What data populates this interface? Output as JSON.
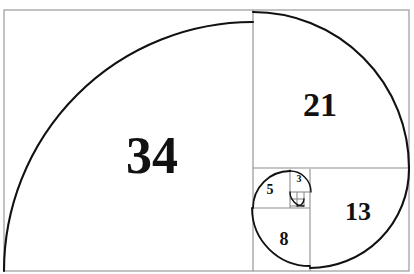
{
  "figure": {
    "background_color": "#ffffff",
    "outer_border_color": "#9a9a9a",
    "grid_line_color": "#8d8d8d",
    "spiral_color": "#111111",
    "label_color": "#111111",
    "outer_frame": {
      "x": 4,
      "y": 10,
      "width": 405,
      "height": 261
    }
  },
  "chart_data": {
    "type": "diagram",
    "xlabel": "",
    "ylabel": "",
    "grid": true,
    "legend_position": "none",
    "sequence": [
      1,
      1,
      2,
      3,
      5,
      8,
      13,
      21,
      34
    ],
    "visible_labels": [
      "34",
      "21",
      "13",
      "8",
      "5",
      "3"
    ],
    "squares": [
      {
        "label": "34",
        "value": 34,
        "x": 4,
        "y": 10,
        "size_w": 249,
        "size_h": 261,
        "label_x": 152,
        "label_y": 156,
        "label_font_px": 52,
        "arc_center_x": 253,
        "arc_center_y": 271,
        "arc_radius": 249,
        "arc_start_deg": 180,
        "arc_end_deg": 270
      },
      {
        "label": "21",
        "value": 21,
        "x": 253,
        "y": 10,
        "size_w": 156,
        "size_h": 158,
        "label_x": 320,
        "label_y": 105,
        "label_font_px": 34,
        "arc_center_x": 253,
        "arc_center_y": 168,
        "arc_radius": 156,
        "arc_start_deg": 270,
        "arc_end_deg": 360
      },
      {
        "label": "13",
        "value": 13,
        "x": 310,
        "y": 169,
        "size_w": 99,
        "size_h": 102,
        "label_x": 358,
        "label_y": 212,
        "label_font_px": 26,
        "arc_center_x": 310,
        "arc_center_y": 169,
        "arc_radius": 99,
        "arc_start_deg": 0,
        "arc_end_deg": 90
      },
      {
        "label": "8",
        "value": 8,
        "x": 253,
        "y": 208,
        "size_w": 57,
        "size_h": 63,
        "label_x": 284,
        "label_y": 239,
        "label_font_px": 18,
        "arc_center_x": 310,
        "arc_center_y": 208,
        "arc_radius": 58,
        "arc_start_deg": 90,
        "arc_end_deg": 180
      },
      {
        "label": "5",
        "value": 5,
        "x": 253,
        "y": 169,
        "size_w": 37,
        "size_h": 39,
        "label_x": 270,
        "label_y": 190,
        "label_font_px": 14,
        "arc_center_x": 290,
        "arc_center_y": 208,
        "arc_radius": 37,
        "arc_start_deg": 180,
        "arc_end_deg": 270
      },
      {
        "label": "3",
        "value": 3,
        "x": 290,
        "y": 169,
        "size_w": 20,
        "size_h": 23,
        "label_x": 299,
        "label_y": 179,
        "label_font_px": 10,
        "arc_center_x": 290,
        "arc_center_y": 192,
        "arc_radius": 21,
        "arc_start_deg": 270,
        "arc_end_deg": 360
      },
      {
        "label": "",
        "value": 2,
        "x": 290,
        "y": 192,
        "size_w": 14,
        "size_h": 14,
        "label_x": 297,
        "label_y": 199,
        "label_font_px": 8,
        "arc_center_x": 304,
        "arc_center_y": 192,
        "arc_radius": 14,
        "arc_start_deg": 90,
        "arc_end_deg": 180
      },
      {
        "label": "",
        "value": 1,
        "x": 290,
        "y": 199,
        "size_w": 7,
        "size_h": 7,
        "label_x": 293,
        "label_y": 202,
        "label_font_px": 7,
        "arc_center_x": 297,
        "arc_center_y": 199,
        "arc_radius": 7,
        "arc_start_deg": 0,
        "arc_end_deg": 90
      }
    ],
    "divider_lines": [
      {
        "name": "vertical-34-21",
        "x1": 253,
        "y1": 10,
        "x2": 253,
        "y2": 271
      },
      {
        "name": "horizontal-21-lower",
        "x1": 253,
        "y1": 168,
        "x2": 409,
        "y2": 168
      },
      {
        "name": "vertical-8-13",
        "x1": 310,
        "y1": 169,
        "x2": 310,
        "y2": 271
      },
      {
        "name": "horizontal-5-8",
        "x1": 253,
        "y1": 208,
        "x2": 310,
        "y2": 208
      },
      {
        "name": "vertical-5-3",
        "x1": 290,
        "y1": 169,
        "x2": 290,
        "y2": 208
      },
      {
        "name": "horizontal-3-2",
        "x1": 290,
        "y1": 192,
        "x2": 310,
        "y2": 192
      },
      {
        "name": "vertical-2-right",
        "x1": 304,
        "y1": 192,
        "x2": 304,
        "y2": 206
      },
      {
        "name": "horizontal-2-bottom",
        "x1": 290,
        "y1": 206,
        "x2": 304,
        "y2": 206
      },
      {
        "name": "horizontal-1-mid",
        "x1": 290,
        "y1": 199,
        "x2": 304,
        "y2": 199
      },
      {
        "name": "vertical-1-mid",
        "x1": 297,
        "y1": 192,
        "x2": 297,
        "y2": 206
      }
    ]
  }
}
